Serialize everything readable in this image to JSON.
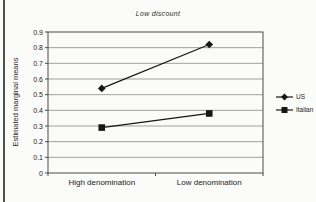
{
  "chart_data": {
    "type": "line",
    "title": "Low discount",
    "categories": [
      "High denomination",
      "Low denomination"
    ],
    "series": [
      {
        "name": "US",
        "marker": "diamond",
        "values": [
          0.54,
          0.82
        ]
      },
      {
        "name": "Italian",
        "marker": "square",
        "values": [
          0.29,
          0.38
        ]
      }
    ],
    "xlabel": "",
    "ylabel": "Estimated marginal means",
    "ylim": [
      0,
      0.9
    ],
    "ytick_step": 0.1,
    "ytick_labels": [
      "0",
      "0.1",
      "0.2",
      "0.3",
      "0.4",
      "0.5",
      "0.6",
      "0.7",
      "0.8",
      "0.9"
    ],
    "grid": true,
    "legend_position": "right",
    "colors": {
      "line": "#161616",
      "grid": "#8a8a8a",
      "axis": "#4a4a4a",
      "text": "#222222",
      "background": "#fbfbf9"
    }
  }
}
